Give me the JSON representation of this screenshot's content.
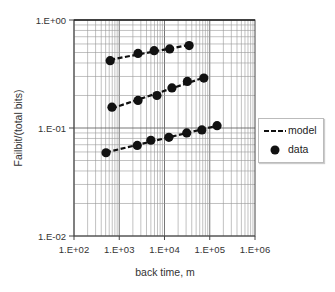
{
  "chart_data": {
    "type": "scatter",
    "title": "",
    "xlabel": "back time, m",
    "ylabel": "Failbit/(total bits)",
    "xscale": "log",
    "yscale": "log",
    "xlim": [
      100,
      1000000
    ],
    "ylim": [
      0.01,
      1
    ],
    "x_ticks": [
      "1.E+02",
      "1.E+03",
      "1.E+04",
      "1.E+05",
      "1.E+06"
    ],
    "y_ticks": [
      "1.E+00",
      "1.E-01",
      "1.E-02"
    ],
    "grid": true,
    "legend_position": "right, outside plot",
    "legend": [
      {
        "label": "model",
        "style": "dashed-line"
      },
      {
        "label": "data",
        "style": "filled-circle"
      }
    ],
    "series": [
      {
        "name": "data (upper)",
        "x": [
          630,
          2600,
          5900,
          13000,
          35000
        ],
        "y": [
          0.42,
          0.49,
          0.52,
          0.54,
          0.58
        ]
      },
      {
        "name": "data (middle)",
        "x": [
          690,
          2600,
          6800,
          14600,
          32000,
          74000
        ],
        "y": [
          0.156,
          0.18,
          0.2,
          0.235,
          0.27,
          0.29
        ]
      },
      {
        "name": "data (lower)",
        "x": [
          510,
          2500,
          5000,
          12500,
          31000,
          67000,
          145000
        ],
        "y": [
          0.059,
          0.069,
          0.077,
          0.082,
          0.09,
          0.096,
          0.105
        ]
      }
    ],
    "colors": {
      "points": "#111111",
      "model_line": "#111111",
      "grid": "#888888",
      "axis": "#444444"
    }
  },
  "legend": {
    "model_label": "model",
    "data_label": "data"
  },
  "axes": {
    "xlabel": "back time, m",
    "ylabel": "Failbit/(total bits)"
  }
}
